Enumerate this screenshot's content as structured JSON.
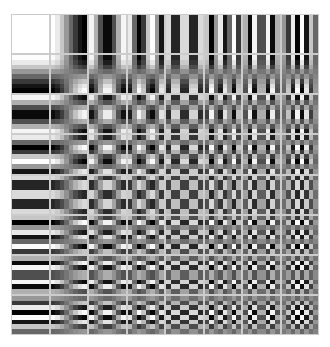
{
  "figure": {
    "title": "",
    "rows": 8,
    "cols": 8,
    "block_size": 8,
    "colors": {
      "background": "#ffffff",
      "low": "#000000",
      "high": "#ffffff"
    }
  }
}
